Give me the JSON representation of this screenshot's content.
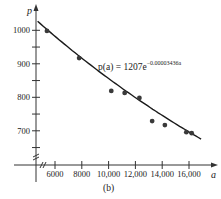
{
  "chart_data": {
    "type": "scatter",
    "title": "",
    "caption": "(b)",
    "xlabel": "a",
    "ylabel": "p",
    "x_ticks": [
      6000,
      8000,
      10000,
      12000,
      14000,
      16000
    ],
    "x_tick_labels": [
      "6000",
      "8000",
      "10,000",
      "12,000",
      "14,000",
      "16,000"
    ],
    "y_ticks": [
      700,
      800,
      900,
      1000
    ],
    "y_tick_labels": [
      "700",
      "800",
      "900",
      "1000"
    ],
    "y_minor_ticks": [
      650,
      750,
      850,
      950
    ],
    "xlim": [
      4650,
      17400
    ],
    "ylim": [
      600,
      1030
    ],
    "axis_breaks": {
      "x": true,
      "y": true
    },
    "grid": false,
    "series": [
      {
        "name": "data",
        "kind": "points",
        "x": [
          5400,
          7800,
          10200,
          11200,
          12300,
          13250,
          14200,
          15800,
          16200
        ],
        "y": [
          998,
          917,
          819,
          813,
          798,
          729,
          717,
          696,
          693
        ]
      },
      {
        "name": "fit",
        "kind": "curve",
        "equation": "p(a) = 1207e^(-0.00003436a)",
        "a": 1207,
        "k": -3.436e-05,
        "x_range": [
          4700,
          17000
        ]
      }
    ],
    "annotation": {
      "main": "p(a) = 1207e",
      "exponent": "−0.00003436a"
    }
  }
}
